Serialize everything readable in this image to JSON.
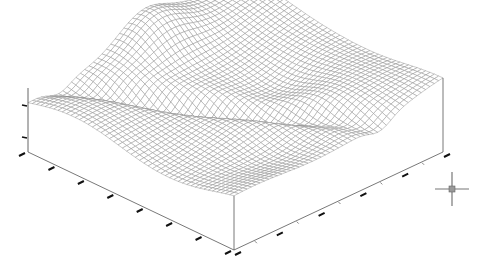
{
  "chart_data": {
    "type": "surface3d-wireframe",
    "title": "",
    "xlabel": "",
    "ylabel": "",
    "zlabel": "",
    "grid": true,
    "legend": null,
    "mesh_resolution": [
      48,
      48
    ],
    "projection": "isometric",
    "box_corners_px": {
      "back_top": [
        237,
        20
      ],
      "left_top": [
        28,
        112
      ],
      "front_top": [
        234,
        218
      ],
      "right_top": [
        443,
        100
      ],
      "left_bottom": [
        28,
        152
      ],
      "front_bottom": [
        234,
        250
      ],
      "right_bottom": [
        443,
        152
      ]
    },
    "z_axis": {
      "ticks_px_y": [
        105,
        137
      ],
      "range": [
        0,
        1
      ]
    },
    "x_axis_ticks": 7,
    "y_axis_ticks": 5,
    "features": [
      {
        "kind": "ridge",
        "location": "back-left",
        "height": 0.9
      },
      {
        "kind": "valley",
        "location": "diagonal channel from left to right-center",
        "depth": 0.35
      },
      {
        "kind": "bowl",
        "location": "right-center",
        "depth": 0.4
      },
      {
        "kind": "plateau",
        "location": "right edge",
        "height": 0.6
      }
    ],
    "line_color": "#8a8a8a",
    "edge_color": "#555555"
  },
  "cursor": {
    "icon": "crosshair-icon",
    "x": 452,
    "y": 189
  }
}
